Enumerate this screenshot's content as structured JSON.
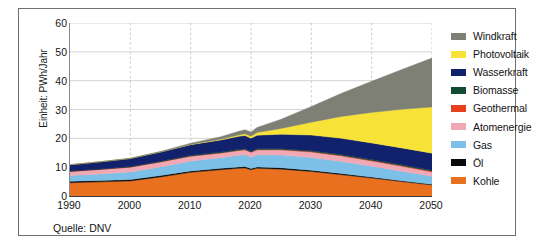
{
  "figure": {
    "source_note": "Quelle: DNV",
    "border_color": "#6e6e6e",
    "background": "#ffffff"
  },
  "axes": {
    "ylabel": "Einheit: PWh/Jahr",
    "yticks": [
      "0",
      "10",
      "20",
      "30",
      "40",
      "50",
      "60"
    ],
    "xticks": [
      "1990",
      "2000",
      "2010",
      "2020",
      "2030",
      "2040",
      "2050"
    ]
  },
  "legend": {
    "position": "right",
    "entries": [
      {
        "label": "Windkraft",
        "color": "#7f8075"
      },
      {
        "label": "Photovoltaik",
        "color": "#f7e237"
      },
      {
        "label": "Wasserkraft",
        "color": "#12216b"
      },
      {
        "label": "Biomasse",
        "color": "#134b34"
      },
      {
        "label": "Geothermal",
        "color": "#e8401f"
      },
      {
        "label": "Atomenergie",
        "color": "#f0a8b4"
      },
      {
        "label": "Gas",
        "color": "#7cc0e8"
      },
      {
        "label": "Öl",
        "color": "#0a0a0a"
      },
      {
        "label": "Kohle",
        "color": "#e8701f"
      }
    ]
  },
  "chart_data": {
    "type": "area",
    "stacked": true,
    "title": "",
    "subtitle": "",
    "xlabel": "",
    "ylabel": "Einheit: PWh/Jahr",
    "unit": "PWh/Jahr",
    "source": "Quelle: DNV",
    "xlim": [
      1990,
      2050
    ],
    "ylim": [
      0,
      60
    ],
    "ytick_step": 10,
    "grid": "horizontal-and-vertical-dashed",
    "stack_order_bottom_to_top": [
      "Kohle",
      "Öl",
      "Gas",
      "Atomenergie",
      "Geothermal",
      "Biomasse",
      "Wasserkraft",
      "Photovoltaik",
      "Windkraft"
    ],
    "x": [
      1990,
      1995,
      2000,
      2005,
      2010,
      2015,
      2018,
      2019,
      2020,
      2021,
      2025,
      2030,
      2035,
      2040,
      2045,
      2050
    ],
    "series": [
      {
        "name": "Kohle",
        "color": "#e8701f",
        "values": [
          4.6,
          4.9,
          5.2,
          6.6,
          8.2,
          9.1,
          9.6,
          9.7,
          9.1,
          9.6,
          9.3,
          8.5,
          7.4,
          6.2,
          5.0,
          3.8
        ]
      },
      {
        "name": "Öl",
        "color": "#0a0a0a",
        "values": [
          0.5,
          0.5,
          0.5,
          0.5,
          0.5,
          0.5,
          0.5,
          0.5,
          0.45,
          0.5,
          0.5,
          0.45,
          0.4,
          0.35,
          0.3,
          0.25
        ]
      },
      {
        "name": "Gas",
        "color": "#7cc0e8",
        "values": [
          2.0,
          2.2,
          2.6,
          3.0,
          3.4,
          3.7,
          4.0,
          4.1,
          4.0,
          4.2,
          4.4,
          4.4,
          4.2,
          3.8,
          3.3,
          2.8
        ]
      },
      {
        "name": "Atomenergie",
        "color": "#f0a8b4",
        "values": [
          1.4,
          1.6,
          1.7,
          1.7,
          1.7,
          1.6,
          1.7,
          1.7,
          1.6,
          1.7,
          1.8,
          1.9,
          1.9,
          1.8,
          1.7,
          1.5
        ]
      },
      {
        "name": "Geothermal",
        "color": "#e8401f",
        "values": [
          0.05,
          0.05,
          0.06,
          0.07,
          0.08,
          0.09,
          0.1,
          0.1,
          0.1,
          0.1,
          0.12,
          0.15,
          0.18,
          0.2,
          0.22,
          0.25
        ]
      },
      {
        "name": "Biomasse",
        "color": "#134b34",
        "values": [
          0.1,
          0.12,
          0.15,
          0.18,
          0.22,
          0.25,
          0.28,
          0.28,
          0.27,
          0.28,
          0.3,
          0.32,
          0.33,
          0.34,
          0.35,
          0.36
        ]
      },
      {
        "name": "Wasserkraft",
        "color": "#12216b",
        "values": [
          2.2,
          2.5,
          2.8,
          3.2,
          3.7,
          4.2,
          4.5,
          4.6,
          4.5,
          4.7,
          5.0,
          5.4,
          5.6,
          5.7,
          5.8,
          5.9
        ]
      },
      {
        "name": "Photovoltaik",
        "color": "#f7e237",
        "values": [
          0.0,
          0.0,
          0.0,
          0.02,
          0.08,
          0.25,
          0.5,
          0.6,
          0.7,
          0.9,
          2.0,
          4.5,
          7.6,
          10.6,
          13.4,
          16.0
        ]
      },
      {
        "name": "Windkraft",
        "color": "#7f8075",
        "values": [
          0.0,
          0.02,
          0.08,
          0.2,
          0.45,
          0.9,
          1.3,
          1.4,
          1.5,
          1.8,
          3.2,
          5.4,
          8.0,
          10.8,
          13.8,
          17.0
        ]
      }
    ],
    "totals": [
      10.85,
      11.89,
      13.09,
      15.47,
      18.33,
      20.59,
      22.48,
      22.98,
      22.22,
      23.78,
      26.62,
      31.02,
      35.61,
      39.79,
      43.87,
      47.86
    ],
    "annotations": [
      {
        "text": "dip around 2020 (pandemic)",
        "x": 2020
      }
    ]
  }
}
